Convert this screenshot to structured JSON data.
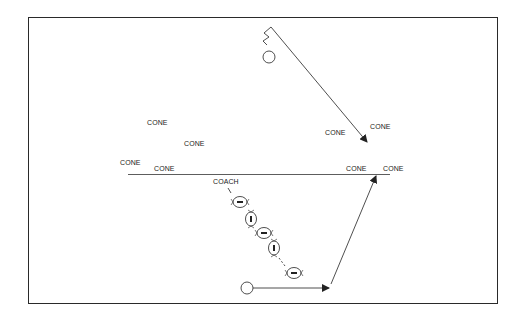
{
  "diagram": {
    "type": "football-drill",
    "colors": {
      "stroke": "#222222",
      "background": "#ffffff",
      "frame": "#2a2a2a"
    },
    "labels": [
      {
        "id": "cone-1",
        "text": "CONE",
        "x": 147,
        "y": 118
      },
      {
        "id": "cone-2",
        "text": "CONE",
        "x": 184,
        "y": 139
      },
      {
        "id": "cone-3",
        "text": "CONE",
        "x": 120,
        "y": 158
      },
      {
        "id": "cone-4",
        "text": "CONE",
        "x": 154,
        "y": 164
      },
      {
        "id": "cone-5",
        "text": "CONE",
        "x": 325,
        "y": 128
      },
      {
        "id": "cone-6",
        "text": "CONE",
        "x": 370,
        "y": 122
      },
      {
        "id": "cone-7",
        "text": "CONE",
        "x": 346,
        "y": 164
      },
      {
        "id": "cone-8",
        "text": "CONE",
        "x": 383,
        "y": 164
      },
      {
        "id": "coach",
        "text": "COACH",
        "x": 213,
        "y": 176
      }
    ],
    "players": [
      {
        "id": "top-player",
        "shape": "circle",
        "x": 269,
        "y": 57,
        "r": 6
      },
      {
        "id": "bottom-player",
        "shape": "circle",
        "x": 247,
        "y": 288,
        "r": 6
      }
    ],
    "footballs": [
      {
        "id": "ball-1",
        "orientation": "horizontal",
        "x": 240,
        "y": 202
      },
      {
        "id": "ball-2",
        "orientation": "vertical",
        "x": 251,
        "y": 219
      },
      {
        "id": "ball-3",
        "orientation": "horizontal",
        "x": 264,
        "y": 233
      },
      {
        "id": "ball-4",
        "orientation": "vertical",
        "x": 274,
        "y": 248
      },
      {
        "id": "ball-5",
        "orientation": "horizontal",
        "x": 294,
        "y": 273
      }
    ],
    "lines": {
      "yard_line": {
        "x1": 128,
        "y1": 174,
        "x2": 390,
        "y2": 174
      },
      "top_route": {
        "x1": 271,
        "y1": 27,
        "x2": 367,
        "y2": 142
      },
      "bottom_run": {
        "x1": 253,
        "y1": 288,
        "x2": 329,
        "y2": 288
      },
      "bottom_route": {
        "x1": 331,
        "y1": 284,
        "x2": 376,
        "y2": 176
      }
    }
  }
}
